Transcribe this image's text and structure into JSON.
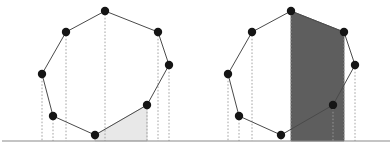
{
  "figure": {
    "width": 392,
    "height": 154,
    "background_color": "#ffffff",
    "baseline": {
      "label": "ground-line",
      "y": 141,
      "x_start": 2,
      "x_end": 390,
      "color": "#8a8a8a",
      "stroke_width": 1.1
    },
    "style": {
      "polygon_edge_color": "#4a4a4a",
      "polygon_edge_width": 1.0,
      "polygon_fill": "none",
      "vertex_fill": "#151515",
      "vertex_radius": 4.2,
      "projection_line_color": "#9a9a9a",
      "projection_line_width": 0.9,
      "projection_dash": "1.6,1.8",
      "light_shade_color": "#e8e8e8",
      "light_shade_stroke": "#c9c9c9",
      "dark_shade_color": "#5e5e5e",
      "dark_shade_stroke": "#4a4a4a"
    },
    "panels": [
      {
        "name": "left-panel",
        "label": "Left diagram: single shaded cell",
        "offset_x": 0,
        "shade_kind": "light",
        "vertices": [
          {
            "id": "v0",
            "label": "apex",
            "x": 105,
            "y": 11
          },
          {
            "id": "v1",
            "label": "upper-right",
            "x": 158,
            "y": 32
          },
          {
            "id": "v2",
            "label": "right",
            "x": 169,
            "y": 65
          },
          {
            "id": "v3",
            "label": "lower-right",
            "x": 147,
            "y": 105
          },
          {
            "id": "v4",
            "label": "bottom",
            "x": 95,
            "y": 135
          },
          {
            "id": "v5",
            "label": "lower-left",
            "x": 53,
            "y": 116
          },
          {
            "id": "v6",
            "label": "left",
            "x": 42,
            "y": 74
          },
          {
            "id": "v7",
            "label": "upper-left",
            "x": 66,
            "y": 32
          }
        ],
        "shaded_region": {
          "label": "swept-cell",
          "points": [
            [
              95,
              135
            ],
            [
              147,
              105
            ],
            [
              147,
              141
            ],
            [
              95,
              141
            ]
          ]
        }
      },
      {
        "name": "right-panel",
        "label": "Right diagram: full dark sweep band",
        "offset_x": 186,
        "shade_kind": "dark",
        "vertices": [
          {
            "id": "v0",
            "label": "apex",
            "x": 291,
            "y": 11
          },
          {
            "id": "v1",
            "label": "upper-right",
            "x": 344,
            "y": 32
          },
          {
            "id": "v2",
            "label": "right",
            "x": 355,
            "y": 65
          },
          {
            "id": "v3",
            "label": "lower-right",
            "x": 333,
            "y": 105
          },
          {
            "id": "v4",
            "label": "bottom",
            "x": 281,
            "y": 135
          },
          {
            "id": "v5",
            "label": "lower-left",
            "x": 239,
            "y": 116
          },
          {
            "id": "v6",
            "label": "left",
            "x": 228,
            "y": 74
          },
          {
            "id": "v7",
            "label": "upper-left",
            "x": 252,
            "y": 32
          }
        ],
        "shaded_region": {
          "label": "swept-band",
          "points": [
            [
              291,
              11
            ],
            [
              344,
              32
            ],
            [
              344,
              141
            ],
            [
              291,
              141
            ]
          ]
        }
      }
    ]
  }
}
